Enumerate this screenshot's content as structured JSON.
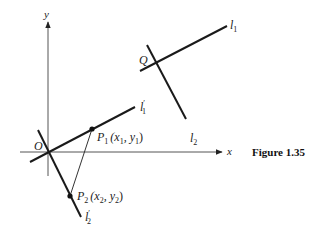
{
  "figure": {
    "caption": "Figure 1.35",
    "axes": {
      "x_label": "x",
      "y_label": "y",
      "origin_label": "O"
    },
    "lines": {
      "l1": {
        "name": "l",
        "sub": "1",
        "prime": ""
      },
      "l2": {
        "name": "l",
        "sub": "2",
        "prime": ""
      },
      "l1p": {
        "name": "l",
        "sub": "1",
        "prime": "′"
      },
      "l2p": {
        "name": "l",
        "sub": "2",
        "prime": "′"
      }
    },
    "points": {
      "Q": {
        "label": "Q"
      },
      "P1": {
        "name": "P",
        "sub": "1",
        "coords_open": "(x",
        "coords_sub1": "1",
        "coords_mid": ", y",
        "coords_sub2": "1",
        "coords_close": ")"
      },
      "P2": {
        "name": "P",
        "sub": "2",
        "coords_open": "(x",
        "coords_sub1": "2",
        "coords_mid": ", y",
        "coords_sub2": "2",
        "coords_close": ")"
      }
    },
    "colors": {
      "ink": "#1a1a1a",
      "axis": "#555555",
      "background": "#ffffff"
    }
  }
}
